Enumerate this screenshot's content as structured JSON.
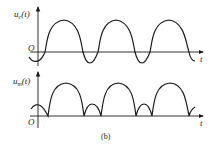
{
  "figure": {
    "caption": "(b)",
    "top_plot": {
      "y_label_main": "u",
      "y_label_sub": "c",
      "y_label_arg": "(t)",
      "x_label": "t",
      "origin_label": "O",
      "description": "Clipped/biased sinusoid: broad positive half-cycles with small negative dips below the axis"
    },
    "bottom_plot": {
      "y_label_main": "u",
      "y_label_sub": "m",
      "y_label_arg": "(t)",
      "x_label": "t",
      "origin_label": "O",
      "description": "Full-wave rectified version: large arches alternating with small arches, all above the axis"
    },
    "colors": {
      "stroke": "#1a1a1a",
      "background": "#ffffff"
    }
  }
}
